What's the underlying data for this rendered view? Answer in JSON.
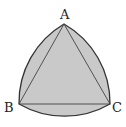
{
  "diagram": {
    "vertices": {
      "A": {
        "label": "A",
        "x": 64,
        "y": 24
      },
      "B": {
        "label": "B",
        "x": 19,
        "y": 104
      },
      "C": {
        "label": "C",
        "x": 110,
        "y": 104
      }
    },
    "colors": {
      "fill": "#c9c9c9",
      "stroke": "#333333",
      "background": "#ffffff"
    }
  }
}
